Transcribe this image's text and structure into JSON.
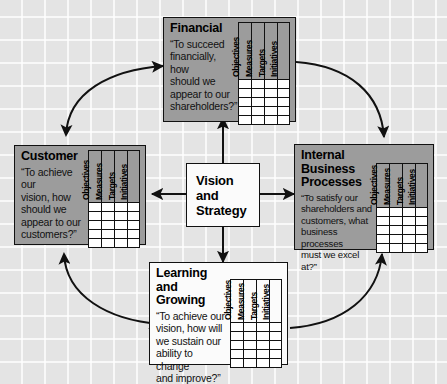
{
  "diagram": {
    "background_color": "#e4e4e4",
    "panel_color": "#9c9c9c",
    "center_color": "#fbfbfb",
    "line_color": "#111111"
  },
  "center": {
    "text": "Vision\nand\nStrategy"
  },
  "table": {
    "columns": [
      "Objectives",
      "Measures",
      "Targets",
      "Initiatives"
    ],
    "row_count": 5
  },
  "panels": {
    "financial": {
      "title": "Financial",
      "quote": "“To succeed\nfinancially, how\nshould we\nappear to our\nshareholders?”"
    },
    "customer": {
      "title": "Customer",
      "quote": "“To achieve our\nvision, how\nshould we\nappear to our\ncustomers?”"
    },
    "internal": {
      "title": "Internal Business\nProcesses",
      "quote": "“To satisfy our\nshareholders and\ncustomers, what\nbusiness processes\nmust we excel at?”"
    },
    "learning": {
      "title": "Learning and\nGrowing",
      "quote": "“To achieve our\nvision, how will\nwe sustain our\nability to change\nand improve?”"
    }
  },
  "connectors": {
    "center_to_financial": "arrow-up",
    "center_to_internal": "arrow-right",
    "center_to_learning": "arrow-down",
    "center_to_customer": "arrow-left",
    "customer_financial": "curved-double-arrow",
    "financial_internal": "curved-arrow",
    "customer_learning": "curved-double-arrow",
    "learning_internal": "curved-arrow"
  }
}
